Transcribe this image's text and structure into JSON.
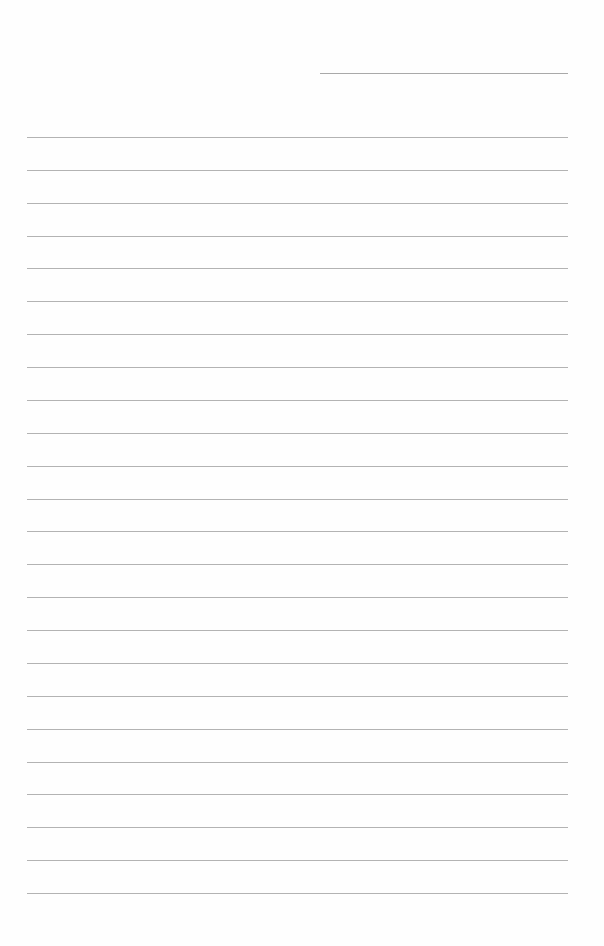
{
  "page": {
    "type": "blank lined paper",
    "background_color": "#fefefe",
    "line_color": "#b3b3b3",
    "header_line": {
      "left": 320,
      "top": 73,
      "width": 248
    },
    "rules": {
      "count": 24,
      "first_top": 137,
      "spacing": 32.87,
      "left": 27,
      "width": 541
    }
  }
}
